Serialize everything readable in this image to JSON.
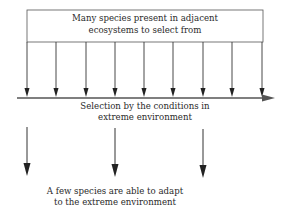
{
  "diagram": {
    "top_box": {
      "line1": "Many species present in adjacent",
      "line2": "ecosystems to select from"
    },
    "selection_label": {
      "line1": "Selection by the conditions in",
      "line2": "extreme environment"
    },
    "result_label": {
      "line1": "A few species are able to adapt",
      "line2": "to the extreme environment"
    },
    "upper_arrow_count": 9,
    "lower_arrow_count": 3,
    "colors": {
      "line": "#333333",
      "text": "#2a2a2a",
      "background": "#ffffff"
    }
  }
}
